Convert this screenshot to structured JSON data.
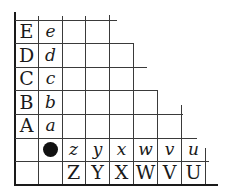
{
  "board": {
    "left_labels": [
      "E",
      "D",
      "C",
      "B",
      "A"
    ],
    "left_sublabels": [
      "e",
      "d",
      "c",
      "b",
      "a"
    ],
    "bottom_sublabels": [
      "z",
      "y",
      "x",
      "w",
      "v",
      "u"
    ],
    "bottom_labels": [
      "Z",
      "Y",
      "X",
      "W",
      "V",
      "U"
    ],
    "stone": {
      "color": "black",
      "position": "row 6, column 2"
    },
    "line_color": "#3a3a3a",
    "border_color": "#1a1a1a"
  }
}
